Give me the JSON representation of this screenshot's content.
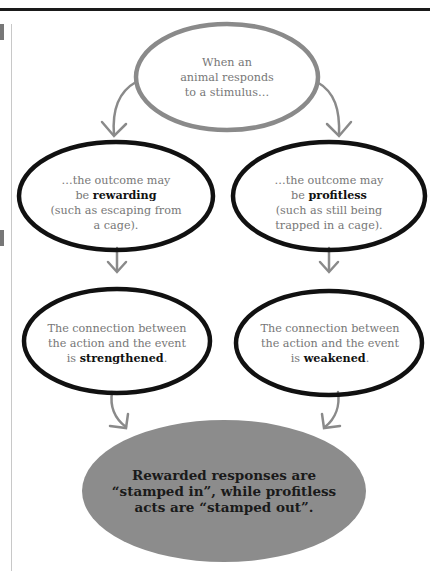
{
  "diagram": {
    "type": "flowchart",
    "nodes": {
      "start": {
        "text": "When an animal responds to a stimulus…",
        "lines": [
          "When an",
          "animal responds",
          "to a stimulus…"
        ]
      },
      "rewarding": {
        "pre": "…the outcome may be ",
        "bold": "rewarding",
        "post": " (such as escaping from a cage).",
        "line1": "…the outcome may",
        "line2_pre": "be ",
        "line2_bold": "rewarding",
        "line3": "(such as escaping from",
        "line4": "a cage)."
      },
      "profitless": {
        "pre": "…the outcome may be ",
        "bold": "profitless",
        "post": " (such as still being trapped in a cage).",
        "line1": "…the outcome may",
        "line2_pre": "be ",
        "line2_bold": "profitless",
        "line3": "(such as still being",
        "line4": "trapped in a cage)."
      },
      "strengthened": {
        "line1": "The connection between",
        "line2": "the action and the event",
        "line3_pre": "is ",
        "line3_bold": "strengthened",
        "line3_post": "."
      },
      "weakened": {
        "line1": "The connection between",
        "line2": "the action and the event",
        "line3_pre": "is ",
        "line3_bold": "weakened",
        "line3_post": "."
      },
      "conclusion": {
        "lines": [
          "Rewarded responses are",
          "“stamped in”, while profitless",
          "acts are “stamped out”."
        ]
      }
    },
    "edges": [
      [
        "start",
        "rewarding"
      ],
      [
        "start",
        "profitless"
      ],
      [
        "rewarding",
        "strengthened"
      ],
      [
        "profitless",
        "weakened"
      ],
      [
        "strengthened",
        "conclusion"
      ],
      [
        "weakened",
        "conclusion"
      ]
    ],
    "colors": {
      "top_oval_stroke": "#8a8a8a",
      "oval_stroke": "#111111",
      "arrow": "#8a8a8a",
      "conclusion_fill": "#8c8c8c",
      "text_gray": "#777777",
      "text_bold": "#111111"
    }
  }
}
